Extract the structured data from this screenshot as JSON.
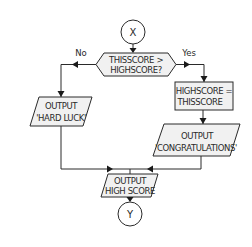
{
  "diagram": {
    "type": "flowchart",
    "start_connector": {
      "label": "X"
    },
    "end_connector": {
      "label": "Y"
    },
    "decision": {
      "line1": "THISSCORE >",
      "line2": "HIGHSCORE?",
      "no_label": "No",
      "yes_label": "Yes"
    },
    "no_branch": {
      "output": {
        "line1": "OUTPUT",
        "line2": "'HARD LUCK'"
      }
    },
    "yes_branch": {
      "process": {
        "line1": "HIGHSCORE =",
        "line2": "THISSCORE"
      },
      "output": {
        "line1": "OUTPUT",
        "line2": "'CONGRATULATIONS'"
      }
    },
    "final_output": {
      "line1": "OUTPUT",
      "line2": "HIGH SCORE"
    },
    "colors": {
      "stroke": "#2a2a2a",
      "shape_fill": "#f1f1f1",
      "background": "#ffffff"
    }
  }
}
